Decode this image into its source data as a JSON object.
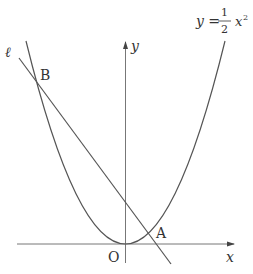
{
  "diagram": {
    "type": "coordinate-plane",
    "axes": {
      "x_label": "x",
      "y_label": "y",
      "origin_label": "O"
    },
    "curve": {
      "equation_prefix": "y =",
      "fraction_numerator": "1",
      "fraction_denominator": "2",
      "variable": "x",
      "exponent": "2"
    },
    "line": {
      "label": "ℓ"
    },
    "points": [
      {
        "label": "A"
      },
      {
        "label": "B"
      }
    ],
    "colors": {
      "stroke": "#555555",
      "text": "#333333"
    }
  }
}
